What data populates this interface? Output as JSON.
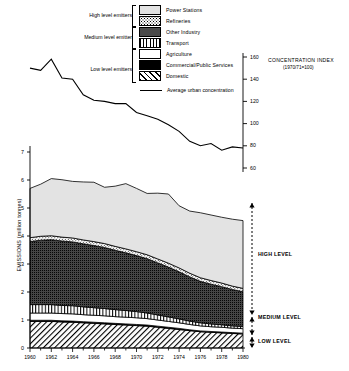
{
  "legend": {
    "items": [
      {
        "label": "Power Stations",
        "pattern": "p-power",
        "name": "power-stations"
      },
      {
        "label": "Refineries",
        "pattern": "p-ref",
        "name": "refineries"
      },
      {
        "label": "Other Industry",
        "pattern": "p-other",
        "name": "other-industry"
      },
      {
        "label": "Transport",
        "pattern": "p-trans",
        "name": "transport"
      },
      {
        "label": "Agriculture",
        "pattern": "p-agri",
        "name": "agriculture"
      },
      {
        "label": "Commercial/Public Services",
        "pattern": "p-comm",
        "name": "commercial-public-services"
      },
      {
        "label": "Domestic",
        "pattern": "p-dom",
        "name": "domestic"
      }
    ],
    "line_label": "Average urban concentration"
  },
  "emitter_groups": [
    {
      "label": "High level emitters"
    },
    {
      "label": "Medium level emitter"
    },
    {
      "label": "Low level emitters"
    }
  ],
  "level_brackets": [
    {
      "label": "HIGH LEVEL"
    },
    {
      "label": "MEDIUM LEVEL"
    },
    {
      "label": "LOW LEVEL"
    }
  ],
  "right_axis": {
    "title": "CONCENTRATION INDEX",
    "subtitle": "(1970/71=100)",
    "ticks": [
      160,
      140,
      120,
      100,
      80,
      60
    ]
  },
  "chart_data": {
    "type": "area",
    "title": "",
    "xlabel": "",
    "ylabel": "EMISSIONS (million tonnes)",
    "xlim": [
      1960,
      1980
    ],
    "ylim": [
      0,
      7
    ],
    "yticks": [
      0,
      1,
      2,
      3,
      4,
      5,
      6,
      7
    ],
    "xticks": [
      1960,
      1962,
      1964,
      1966,
      1968,
      1970,
      1972,
      1974,
      1976,
      1978,
      1980
    ],
    "x": [
      1960,
      1961,
      1962,
      1963,
      1964,
      1965,
      1966,
      1967,
      1968,
      1969,
      1970,
      1971,
      1972,
      1973,
      1974,
      1975,
      1976,
      1977,
      1978,
      1979,
      1980
    ],
    "stacked": true,
    "series": [
      {
        "name": "Domestic",
        "pattern": "p-dom",
        "values": [
          0.95,
          0.95,
          0.95,
          0.93,
          0.92,
          0.9,
          0.88,
          0.86,
          0.84,
          0.82,
          0.8,
          0.78,
          0.74,
          0.7,
          0.66,
          0.62,
          0.58,
          0.56,
          0.54,
          0.52,
          0.5
        ]
      },
      {
        "name": "Commercial/Public Services",
        "pattern": "p-comm",
        "values": [
          0.04,
          0.04,
          0.04,
          0.04,
          0.04,
          0.04,
          0.04,
          0.04,
          0.04,
          0.04,
          0.04,
          0.04,
          0.04,
          0.04,
          0.04,
          0.03,
          0.03,
          0.03,
          0.03,
          0.03,
          0.03
        ]
      },
      {
        "name": "Agriculture",
        "pattern": "p-agri",
        "values": [
          0.26,
          0.26,
          0.26,
          0.26,
          0.26,
          0.25,
          0.25,
          0.25,
          0.24,
          0.24,
          0.24,
          0.23,
          0.22,
          0.21,
          0.2,
          0.19,
          0.18,
          0.17,
          0.17,
          0.16,
          0.16
        ]
      },
      {
        "name": "Transport",
        "pattern": "p-trans",
        "values": [
          0.3,
          0.3,
          0.3,
          0.29,
          0.29,
          0.28,
          0.27,
          0.26,
          0.25,
          0.24,
          0.22,
          0.2,
          0.18,
          0.16,
          0.14,
          0.12,
          0.11,
          0.1,
          0.09,
          0.08,
          0.08
        ]
      },
      {
        "name": "Other Industry",
        "pattern": "p-other",
        "values": [
          2.25,
          2.3,
          2.32,
          2.3,
          2.28,
          2.25,
          2.22,
          2.18,
          2.12,
          2.06,
          2.0,
          1.94,
          1.86,
          1.78,
          1.68,
          1.58,
          1.48,
          1.42,
          1.36,
          1.3,
          1.24
        ]
      },
      {
        "name": "Refineries",
        "pattern": "p-ref",
        "values": [
          0.14,
          0.14,
          0.14,
          0.14,
          0.14,
          0.14,
          0.14,
          0.14,
          0.14,
          0.14,
          0.14,
          0.14,
          0.14,
          0.14,
          0.14,
          0.13,
          0.13,
          0.13,
          0.13,
          0.12,
          0.12
        ]
      },
      {
        "name": "Power Stations",
        "pattern": "p-power",
        "values": [
          1.76,
          1.86,
          2.04,
          2.05,
          2.02,
          2.07,
          2.12,
          2.01,
          2.15,
          2.33,
          2.26,
          2.19,
          2.35,
          2.47,
          2.22,
          2.22,
          2.32,
          2.34,
          2.35,
          2.39,
          2.42
        ]
      }
    ],
    "line_series": {
      "name": "Average urban concentration",
      "axis": "right",
      "ylim": [
        60,
        160
      ],
      "x": [
        1960,
        1961,
        1962,
        1963,
        1964,
        1965,
        1966,
        1967,
        1968,
        1969,
        1970,
        1971,
        1972,
        1973,
        1974,
        1975,
        1976,
        1977,
        1978,
        1979,
        1980
      ],
      "values": [
        150,
        148,
        158,
        141,
        140,
        126,
        121,
        120,
        118,
        118,
        110,
        107,
        104,
        99,
        93,
        84,
        80,
        82,
        76,
        79,
        78
      ]
    }
  }
}
